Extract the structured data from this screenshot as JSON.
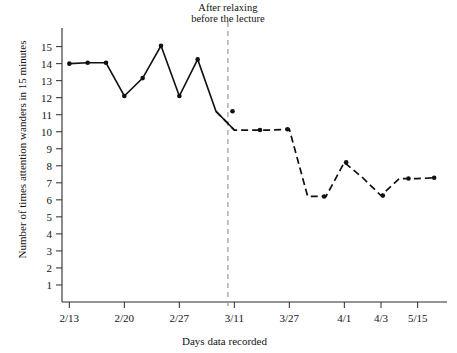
{
  "chart_data": {
    "type": "line",
    "title": "",
    "subtitle": "",
    "xlabel": "Days data recorded",
    "ylabel": "Number of times attention wanders in 15 minutes",
    "ylim": [
      0,
      15.8
    ],
    "yticks": [
      1,
      2,
      3,
      4,
      5,
      6,
      7,
      8,
      9,
      10,
      11,
      12,
      13,
      14,
      15
    ],
    "ytick_labels": [
      "1",
      "2",
      "3",
      "4",
      "5",
      "6",
      "7",
      "8",
      "9",
      "10",
      "11",
      "12",
      "13",
      "14",
      "15"
    ],
    "xtick_labels": [
      "2/13",
      "2/20",
      "2/27",
      "3/11",
      "3/27",
      "4/1",
      "4/3",
      "5/15"
    ],
    "xtick_positions": [
      1,
      4,
      7,
      10,
      13,
      16,
      18,
      20
    ],
    "grid": false,
    "legend": false,
    "legend_position": "none",
    "annotations": [
      {
        "name": "phase-divider-label",
        "line1": "After relaxing",
        "line2": "before the lecture",
        "x": 9.65
      }
    ],
    "phase_divider_x": 9.65,
    "series": [
      {
        "name": "baseline-phase",
        "style": "solid",
        "x": [
          1,
          2,
          3,
          4,
          5,
          6,
          7,
          8,
          9,
          10
        ],
        "values": [
          14.0,
          14.05,
          14.05,
          12.1,
          13.15,
          15.05,
          12.1,
          14.25,
          11.2,
          10.1
        ]
      },
      {
        "name": "after-relaxing-phase",
        "style": "dashed",
        "x": [
          9,
          10,
          11,
          12,
          13,
          14,
          15,
          16,
          17,
          18,
          19,
          20,
          21
        ],
        "values": [
          11.2,
          10.1,
          10.1,
          10.1,
          10.15,
          6.2,
          6.2,
          8.2,
          7.3,
          6.25,
          7.25,
          7.25,
          7.3
        ]
      }
    ],
    "points_solid": [
      {
        "x": 1,
        "y": 14.0
      },
      {
        "x": 2,
        "y": 14.05
      },
      {
        "x": 3,
        "y": 14.05
      },
      {
        "x": 4,
        "y": 12.1
      },
      {
        "x": 5,
        "y": 13.15
      },
      {
        "x": 6,
        "y": 15.05
      },
      {
        "x": 7,
        "y": 12.1
      },
      {
        "x": 8,
        "y": 14.25
      }
    ],
    "points_dashed": [
      {
        "x": 9.9,
        "y": 11.2
      },
      {
        "x": 11.4,
        "y": 10.1
      },
      {
        "x": 12.9,
        "y": 10.15
      },
      {
        "x": 14.9,
        "y": 6.2
      },
      {
        "x": 16.1,
        "y": 8.2
      },
      {
        "x": 18.1,
        "y": 6.25
      },
      {
        "x": 19.5,
        "y": 7.25
      },
      {
        "x": 20.9,
        "y": 7.3
      }
    ],
    "colors": {
      "line": "#111111",
      "marker": "#111111",
      "axis": "#2b2b2b",
      "divider": "#9a9a9a",
      "background": "#ffffff"
    }
  }
}
